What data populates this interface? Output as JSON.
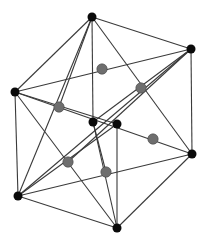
{
  "diagram": {
    "type": "polytope-projection",
    "colors": {
      "edge": "#3a3a3a",
      "black_node": "#0a0a0a",
      "gray_node": "#6e6e6e",
      "background": "#ffffff"
    },
    "nodes": [
      {
        "id": "T",
        "x": 92,
        "y": 17,
        "kind": "black"
      },
      {
        "id": "RT",
        "x": 191,
        "y": 49,
        "kind": "black"
      },
      {
        "id": "L",
        "x": 15,
        "y": 92,
        "kind": "black"
      },
      {
        "id": "C1",
        "x": 93,
        "y": 122,
        "kind": "black"
      },
      {
        "id": "C2",
        "x": 117,
        "y": 124,
        "kind": "black"
      },
      {
        "id": "RB",
        "x": 192,
        "y": 154,
        "kind": "black"
      },
      {
        "id": "BL",
        "x": 18,
        "y": 196,
        "kind": "black"
      },
      {
        "id": "B",
        "x": 117,
        "y": 228,
        "kind": "black"
      },
      {
        "id": "G1",
        "x": 102,
        "y": 69,
        "kind": "gray"
      },
      {
        "id": "G2",
        "x": 141,
        "y": 88,
        "kind": "gray"
      },
      {
        "id": "G3",
        "x": 59,
        "y": 107,
        "kind": "gray"
      },
      {
        "id": "G4",
        "x": 153,
        "y": 139,
        "kind": "gray"
      },
      {
        "id": "G5",
        "x": 68,
        "y": 162,
        "kind": "gray"
      },
      {
        "id": "G6",
        "x": 106,
        "y": 172,
        "kind": "gray"
      }
    ],
    "edges": [
      [
        "T",
        "RT"
      ],
      [
        "T",
        "L"
      ],
      [
        "T",
        "C1"
      ],
      [
        "T",
        "RB"
      ],
      [
        "T",
        "BL"
      ],
      [
        "RT",
        "RB"
      ],
      [
        "RT",
        "L"
      ],
      [
        "RT",
        "C1"
      ],
      [
        "RT",
        "BL"
      ],
      [
        "RT",
        "G5"
      ],
      [
        "L",
        "BL"
      ],
      [
        "L",
        "C2"
      ],
      [
        "L",
        "RB"
      ],
      [
        "L",
        "B"
      ],
      [
        "BL",
        "B"
      ],
      [
        "BL",
        "RB"
      ],
      [
        "BL",
        "C2"
      ],
      [
        "B",
        "C2"
      ],
      [
        "B",
        "RB"
      ],
      [
        "B",
        "C1"
      ],
      [
        "T",
        "G3"
      ],
      [
        "C1",
        "G6"
      ]
    ]
  }
}
